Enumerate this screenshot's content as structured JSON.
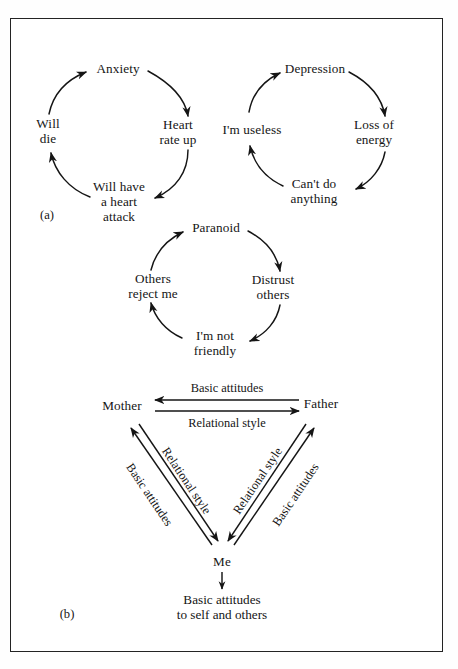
{
  "figure": {
    "type": "diagram",
    "background_color": "#ffffff",
    "ink_color": "#151515",
    "border_color": "#232323"
  },
  "panels": [
    {
      "id": "a",
      "label": "(a)"
    },
    {
      "id": "b",
      "label": "(b)"
    }
  ],
  "cycles": [
    {
      "name": "anxiety-cycle",
      "nodes": [
        {
          "id": "anxiety",
          "text": "Anxiety",
          "x": 118,
          "y": 69
        },
        {
          "id": "heart-rate-up",
          "text": "Heart\nrate up",
          "x": 178,
          "y": 133
        },
        {
          "id": "heart-attack",
          "text": "Will have\na heart\nattack",
          "x": 119,
          "y": 202
        },
        {
          "id": "will-die",
          "text": "Will\ndie",
          "x": 48,
          "y": 132
        }
      ],
      "arrows": [
        "anxiety→heart-rate-up",
        "heart-rate-up→heart-attack",
        "heart-attack→will-die",
        "will-die→anxiety"
      ]
    },
    {
      "name": "depression-cycle",
      "nodes": [
        {
          "id": "depression",
          "text": "Depression",
          "x": 315,
          "y": 69
        },
        {
          "id": "loss-of-energy",
          "text": "Loss of\nenergy",
          "x": 374,
          "y": 133
        },
        {
          "id": "cant-do",
          "text": "Can't do\nanything",
          "x": 314,
          "y": 192
        },
        {
          "id": "im-useless",
          "text": "I'm useless",
          "x": 252,
          "y": 130
        }
      ],
      "arrows": [
        "depression→loss-of-energy",
        "loss-of-energy→cant-do",
        "cant-do→im-useless",
        "im-useless→depression"
      ]
    },
    {
      "name": "paranoid-cycle",
      "nodes": [
        {
          "id": "paranoid",
          "text": "Paranoid",
          "x": 216,
          "y": 228
        },
        {
          "id": "distrust",
          "text": "Distrust\nothers",
          "x": 273,
          "y": 288
        },
        {
          "id": "not-friendly",
          "text": "I'm not\nfriendly",
          "x": 215,
          "y": 344
        },
        {
          "id": "others-reject",
          "text": "Others\nreject me",
          "x": 153,
          "y": 287
        }
      ],
      "arrows": [
        "paranoid→distrust",
        "distrust→not-friendly",
        "not-friendly→others-reject",
        "others-reject→paranoid"
      ]
    }
  ],
  "triangle": {
    "name": "family-relational-triangle",
    "nodes": [
      {
        "id": "mother",
        "text": "Mother",
        "x": 122,
        "y": 406
      },
      {
        "id": "father",
        "text": "Father",
        "x": 321,
        "y": 404
      },
      {
        "id": "me",
        "text": "Me",
        "x": 222,
        "y": 562
      }
    ],
    "edge_labels": {
      "father_to_mother": "Basic attitudes",
      "mother_to_father": "Relational style",
      "me_to_mother": "Basic attitudes",
      "mother_to_me": "Relational style",
      "me_to_father": "Basic attitudes",
      "father_to_me": "Relational style"
    },
    "outcome": "Basic attitudes\nto self and others"
  }
}
